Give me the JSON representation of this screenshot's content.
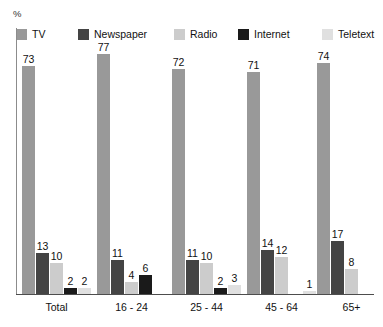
{
  "chart_data": {
    "type": "bar",
    "title": "",
    "subtitle": "",
    "xlabel": "",
    "ylabel": "%",
    "ylim": [
      0,
      80
    ],
    "grid": false,
    "legend_position": "top",
    "categories": [
      "Total",
      "16 - 24",
      "25 - 44",
      "45 - 64",
      "65+"
    ],
    "series": [
      {
        "name": "TV",
        "color": "#999999",
        "values": [
          73,
          77,
          72,
          71,
          74
        ]
      },
      {
        "name": "Newspaper",
        "color": "#444444",
        "values": [
          13,
          11,
          11,
          14,
          17
        ]
      },
      {
        "name": "Radio",
        "color": "#cccccc",
        "values": [
          10,
          4,
          10,
          12,
          8
        ]
      },
      {
        "name": "Internet",
        "color": "#1a1a1a",
        "values": [
          2,
          6,
          2,
          null,
          null
        ]
      },
      {
        "name": "Teletext",
        "color": "#e0e0e0",
        "values": [
          2,
          null,
          3,
          1,
          null
        ]
      }
    ],
    "value_labels": [
      [
        "73",
        "13",
        "10",
        "2",
        "2"
      ],
      [
        "77",
        "11",
        "4",
        "6",
        ""
      ],
      [
        "72",
        "11",
        "10",
        "2",
        "3"
      ],
      [
        "71",
        "14",
        "12",
        "",
        "1"
      ],
      [
        "74",
        "17",
        "8",
        "",
        ""
      ]
    ]
  },
  "axis": {
    "y_title": "%"
  },
  "legend": {
    "items": [
      {
        "label": "TV",
        "color": "#999999"
      },
      {
        "label": "Newspaper",
        "color": "#444444"
      },
      {
        "label": "Radio",
        "color": "#cccccc"
      },
      {
        "label": "Internet",
        "color": "#1a1a1a"
      },
      {
        "label": "Teletext",
        "color": "#e0e0e0"
      }
    ]
  }
}
